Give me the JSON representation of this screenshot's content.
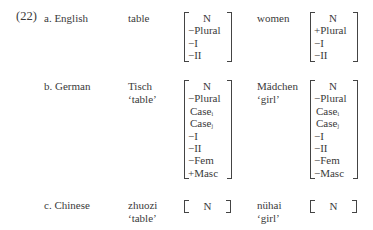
{
  "example_number": "(22)",
  "rows": [
    {
      "label": "a. English",
      "word1": {
        "form": "table",
        "gloss": ""
      },
      "features1": [
        "N",
        "−Plural",
        "−I",
        "−II"
      ],
      "word2": {
        "form": "women",
        "gloss": ""
      },
      "features2": [
        "N",
        "+Plural",
        "−I",
        "−II"
      ]
    },
    {
      "label": "b. German",
      "word1": {
        "form": "Tisch",
        "gloss": "‘table’"
      },
      "features1": [
        "N",
        "−Plural",
        "Case",
        "Case",
        "−I",
        "−II",
        "−Fem",
        "+Masc"
      ],
      "case_subscripts1": [
        "i",
        "j"
      ],
      "word2": {
        "form": "Mädchen",
        "gloss": "‘girl’"
      },
      "features2": [
        "N",
        "−Plural",
        "Case",
        "Case",
        "−I",
        "−II",
        "−Fem",
        "−Masc"
      ],
      "case_subscripts2": [
        "i",
        "j"
      ]
    },
    {
      "label": "c. Chinese",
      "word1": {
        "form": "zhuozi",
        "gloss": "‘table’"
      },
      "features1": [
        "N"
      ],
      "word2": {
        "form": "nühai",
        "gloss": "‘girl’"
      },
      "features2": [
        "N"
      ]
    }
  ]
}
